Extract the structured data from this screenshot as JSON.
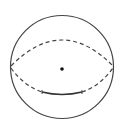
{
  "diagram": {
    "type": "sphere",
    "stroke_color": "#444444",
    "center_dot_color": "#111111",
    "background": "#ffffff",
    "labels": []
  }
}
